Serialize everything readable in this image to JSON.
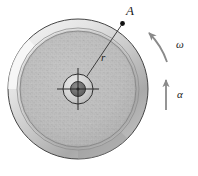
{
  "figure": {
    "kind": "rotating-disk-diagram",
    "background_color": "#ffffff",
    "labels": {
      "point_a": "A",
      "radius": "r",
      "angular_velocity": "ω",
      "angular_acceleration": "α"
    },
    "colors": {
      "outline": "#3a3a3a",
      "rim_light": "#e6e6e6",
      "rim_mid": "#cfcfcf",
      "rim_dark": "#a8a8a8",
      "disk_face": "#b9b9b9",
      "disk_speckle": "#9a9a9a",
      "hub_ring": "#d8d8d8",
      "hub_core": "#6e6e6e",
      "arrow": "#8c8c8c",
      "marker": "#111111",
      "leader_line": "#4a4a4a"
    },
    "geometry": {
      "center_x": 78,
      "center_y": 89,
      "outer_radius": 70,
      "rim_inner_radius": 61,
      "disk_radius": 58,
      "hub_outer_radius": 15,
      "hub_core_radius": 7,
      "point_a_x": 123,
      "point_a_y": 23
    },
    "annotations": {
      "omega_arrow": "curved-ccw-arrow",
      "alpha_arrow": "straight-up-arrow",
      "radius_line": "center-to-point-a",
      "crosshair": "hub-center-crosshair"
    }
  }
}
